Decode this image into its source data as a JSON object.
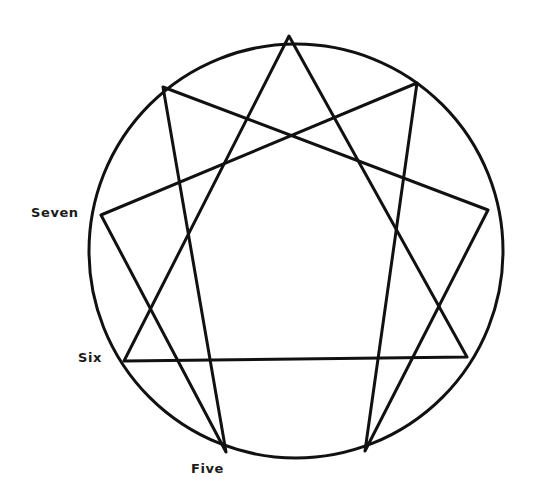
{
  "diagram": {
    "type": "enneagram",
    "stroke_color": "#111111",
    "background_color": "#ffffff",
    "circle": {
      "cx": 296,
      "cy": 251,
      "r": 207
    },
    "points": {
      "nine": {
        "x": 289,
        "y": 36
      },
      "one": {
        "x": 417,
        "y": 83
      },
      "two": {
        "x": 488,
        "y": 210
      },
      "three": {
        "x": 467,
        "y": 357
      },
      "four": {
        "x": 365,
        "y": 451
      },
      "five": {
        "x": 226,
        "y": 452
      },
      "six": {
        "x": 124,
        "y": 361
      },
      "seven": {
        "x": 101,
        "y": 215
      },
      "eight": {
        "x": 163,
        "y": 87
      }
    },
    "labels": {
      "seven": "Seven",
      "six": "Six",
      "five": "Five"
    }
  }
}
